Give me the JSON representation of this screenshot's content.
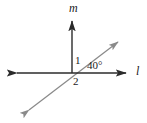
{
  "figure": {
    "background_color": "#ffffff",
    "width": 147,
    "height": 123,
    "line_color_primary": "#2b2b2b",
    "line_color_secondary": "#8a8a8a",
    "text_color": "#1b1b1b"
  },
  "labels": {
    "line_m": "m",
    "line_l": "l",
    "angle_1": "1",
    "angle_2": "2",
    "angle_40": "40°"
  },
  "geometry": {
    "intersection": {
      "x": 72,
      "y": 73
    },
    "lines": [
      {
        "name": "ray-m-vertical",
        "label": "m",
        "color": "#2b2b2b",
        "from": {
          "x": 72,
          "y": 73
        },
        "to": {
          "x": 72,
          "y": 19
        },
        "arrows": "end"
      },
      {
        "name": "line-l-horizontal",
        "label": "l",
        "color": "#2b2b2b",
        "from": {
          "x": 15,
          "y": 73
        },
        "to": {
          "x": 128,
          "y": 73
        },
        "arrows": "both"
      },
      {
        "name": "transversal-diagonal",
        "label": "",
        "color": "#8a8a8a",
        "from": {
          "x": 27,
          "y": 112
        },
        "to": {
          "x": 120,
          "y": 41
        },
        "arrows": "both"
      }
    ],
    "angles": [
      {
        "name": "angle-1",
        "label": "1",
        "between": [
          "ray-m-vertical",
          "transversal-diagonal"
        ],
        "value_deg": 50
      },
      {
        "name": "angle-2",
        "label": "2",
        "between": [
          "transversal-diagonal",
          "line-l-horizontal"
        ],
        "value_deg": 140
      },
      {
        "name": "angle-40",
        "label": "40°",
        "between": [
          "transversal-diagonal",
          "line-l-horizontal"
        ],
        "value_deg": 40
      }
    ]
  }
}
